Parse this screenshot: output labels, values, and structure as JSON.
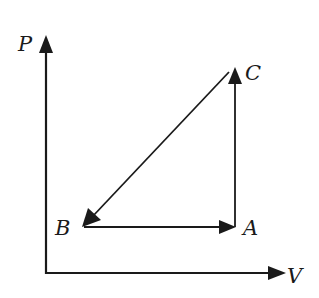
{
  "diagram": {
    "type": "pv-cycle",
    "axes": {
      "y_label": "P",
      "x_label": "V"
    },
    "points": {
      "A": {
        "label": "A"
      },
      "B": {
        "label": "B"
      },
      "C": {
        "label": "C"
      }
    },
    "process_arrows": [
      {
        "from": "A",
        "to": "C",
        "description": "vertical, pressure increase at constant volume"
      },
      {
        "from": "C",
        "to": "B",
        "description": "diagonal, pressure and volume decrease"
      },
      {
        "from": "B",
        "to": "A",
        "description": "horizontal, volume increase at constant pressure"
      }
    ],
    "colors": {
      "ink": "#1a1a1a",
      "background": "#ffffff"
    }
  }
}
